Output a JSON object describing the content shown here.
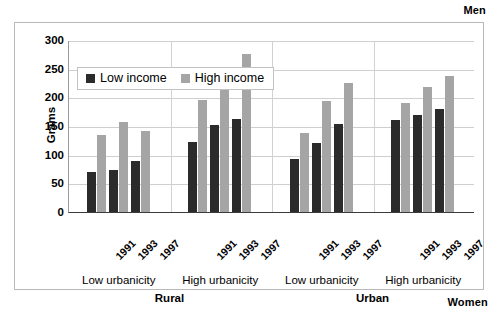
{
  "figure": {
    "top_right_label": "Men",
    "bottom_right_label": "Women"
  },
  "legend": {
    "items": [
      {
        "label": "Low income",
        "color": "#2b2b2b"
      },
      {
        "label": "High income",
        "color": "#a5a5a5"
      }
    ]
  },
  "axis": {
    "ylabel": "Grams",
    "yticks": [
      "0",
      "50",
      "100",
      "150",
      "200",
      "250",
      "300"
    ]
  },
  "groups": [
    {
      "block": "Rural",
      "subgroups": [
        {
          "label": "Low urbanicity",
          "years": [
            "1991",
            "1993",
            "1997"
          ]
        },
        {
          "label": "High urbanicity",
          "years": [
            "1991",
            "1993",
            "1997"
          ]
        }
      ]
    },
    {
      "block": "Urban",
      "subgroups": [
        {
          "label": "Low urbanicity",
          "years": [
            "1991",
            "1993",
            "1997"
          ]
        },
        {
          "label": "High urbanicity",
          "years": [
            "1991",
            "1993",
            "1997"
          ]
        }
      ]
    }
  ],
  "chart_data": {
    "type": "bar",
    "title": "",
    "xlabel": "",
    "ylabel": "Grams",
    "ylim": [
      0,
      300
    ],
    "ytick_step": 50,
    "grid": true,
    "legend_position": "top-left-inside",
    "categories": [
      "Rural / Low urbanicity / 1991",
      "Rural / Low urbanicity / 1993",
      "Rural / Low urbanicity / 1997",
      "Rural / High urbanicity / 1991",
      "Rural / High urbanicity / 1993",
      "Rural / High urbanicity / 1997",
      "Urban / Low urbanicity / 1991",
      "Urban / Low urbanicity / 1993",
      "Urban / Low urbanicity / 1997",
      "Urban / High urbanicity / 1991",
      "Urban / High urbanicity / 1993",
      "Urban / High urbanicity / 1997"
    ],
    "series": [
      {
        "name": "Low income",
        "color": "#2b2b2b",
        "values": [
          70,
          74,
          89,
          122,
          152,
          163,
          92,
          121,
          154,
          161,
          170,
          179
        ]
      },
      {
        "name": "High income",
        "color": "#a5a5a5",
        "values": [
          135,
          157,
          142,
          196,
          221,
          275,
          137,
          193,
          225,
          191,
          218,
          237
        ]
      }
    ],
    "annotations": [
      "Men",
      "Women"
    ]
  }
}
